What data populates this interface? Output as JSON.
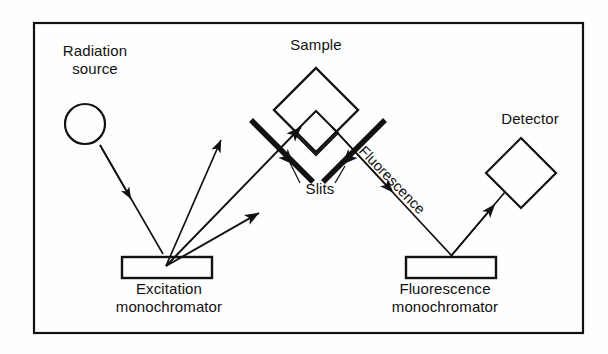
{
  "figure": {
    "kind": "schematic-diagram",
    "background_color": "#fefefe",
    "ink_color": "#111111",
    "frame": {
      "name": "outer-border",
      "x": 34,
      "y": 23,
      "width": 549,
      "height": 310,
      "stroke_width": 2.2
    }
  },
  "labels": {
    "radiation_source_line1": "Radiation",
    "radiation_source_line2": "source",
    "sample": "Sample",
    "detector": "Detector",
    "slits": "Slits",
    "fluorescence_ray": "Fluorescence",
    "excitation_mono_line1": "Excitation",
    "excitation_mono_line2": "monochromator",
    "fluorescence_mono_line1": "Fluorescence",
    "fluorescence_mono_line2": "monochromator"
  },
  "components": {
    "radiation_source": {
      "name": "radiation-source-lamp",
      "shape": "circle",
      "cx": 85,
      "cy": 124,
      "r": 20,
      "stroke_width": 2.2
    },
    "excitation_monochromator": {
      "name": "excitation-monochromator-box",
      "shape": "rectangle",
      "x": 122,
      "y": 257,
      "width": 90,
      "height": 21,
      "stroke_width": 2.4
    },
    "fluorescence_monochromator": {
      "name": "fluorescence-monochromator-box",
      "shape": "rectangle",
      "x": 406,
      "y": 257,
      "width": 90,
      "height": 21,
      "stroke_width": 2.4
    },
    "sample_cuvette_outer": {
      "name": "sample-cuvette-diamond",
      "shape": "diamond",
      "cx": 316,
      "cy": 110,
      "half_diagonal": 42,
      "stroke_width": 2.4
    },
    "sample_cuvette_inner": {
      "name": "sample-cuvette-inner-diamond",
      "shape": "diamond",
      "cx": 316,
      "cy": 133,
      "half_diagonal": 22,
      "stroke_width": 2.0
    },
    "detector": {
      "name": "detector-diamond",
      "shape": "diamond",
      "cx": 521,
      "cy": 173,
      "half_diagonal": 35,
      "stroke_width": 2.2
    },
    "slit_left": {
      "name": "left-slit-bar",
      "shape": "thick-line",
      "x1": 253,
      "y1": 122,
      "x2": 311,
      "y2": 180,
      "stroke_width": 5.5
    },
    "slit_right": {
      "name": "right-slit-bar",
      "shape": "thick-line",
      "x1": 383,
      "y1": 122,
      "x2": 325,
      "y2": 180,
      "stroke_width": 5.5
    }
  },
  "rays": {
    "lamp_to_excitation": {
      "name": "ray-lamp-to-excitation-monochromator",
      "x1": 100,
      "y1": 145,
      "x2": 163,
      "y2": 254,
      "arrowhead_at": 0.47
    },
    "excitation_out_upper": {
      "name": "ray-excitation-out-upper",
      "x1": 166,
      "y1": 266,
      "x2": 221,
      "y2": 140
    },
    "excitation_out_middle": {
      "name": "ray-excitation-out-middle-to-sample",
      "x1": 166,
      "y1": 266,
      "x2": 300,
      "y2": 128
    },
    "excitation_out_lower": {
      "name": "ray-excitation-out-lower",
      "x1": 166,
      "y1": 266,
      "x2": 258,
      "y2": 214
    },
    "sample_to_fluorescence_mono": {
      "name": "ray-fluorescence-to-monochromator",
      "x1": 332,
      "y1": 128,
      "x2": 452,
      "y2": 255,
      "arrowhead_at": 0.46
    },
    "fluorescence_mono_to_detector": {
      "name": "ray-monochromator-to-detector",
      "x1": 451,
      "y1": 256,
      "x2": 504,
      "y2": 193,
      "arrowhead_at": 0.72
    }
  },
  "leaders": {
    "slit_left_leader": {
      "name": "slits-leader-left",
      "x1": 300,
      "y1": 182,
      "x2": 289,
      "y2": 162
    },
    "slit_right_leader": {
      "name": "slits-leader-right",
      "x1": 334,
      "y1": 182,
      "x2": 344,
      "y2": 165
    }
  }
}
